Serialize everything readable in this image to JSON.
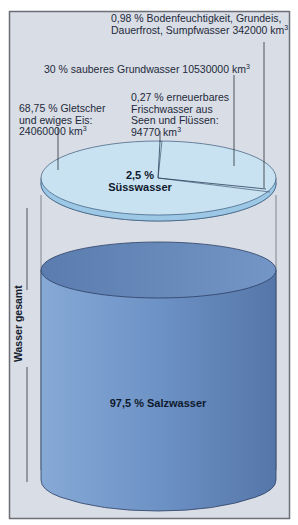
{
  "diagram": {
    "vertical_label": "Wasser gesamt",
    "salt_water": {
      "label": "97,5 % Salzwasser",
      "percent": 97.5
    },
    "fresh_water": {
      "label_line1": "2,5 %",
      "label_line2": "Süsswasser",
      "percent": 2.5
    },
    "fresh_breakdown": [
      {
        "id": "glaciers",
        "line1": "68,75 % Gletscher",
        "line2": "und ewiges Eis:",
        "line3": "24060000 km",
        "unit_sup": "3",
        "percent": 68.75,
        "volume_km3": 24060000
      },
      {
        "id": "groundwater",
        "line1": "30 % sauberes Grundwasser 10530000 km",
        "unit_sup": "3",
        "percent": 30,
        "volume_km3": 10530000
      },
      {
        "id": "lakes_rivers",
        "line1": "0,27 % erneuerbares",
        "line2": "Frischwasser aus",
        "line3": "Seen und Flüssen:",
        "line4": "94770 km",
        "unit_sup": "3",
        "percent": 0.27,
        "volume_km3": 94770
      },
      {
        "id": "soil_moisture",
        "line1": "0,98 % Bodenfeuchtigkeit, Grundeis,",
        "line2": "Dauerfrost, Sumpfwasser 342000 km",
        "unit_sup": "3",
        "percent": 0.98,
        "volume_km3": 342000
      }
    ],
    "colors": {
      "frame_bg": "#d9dde6",
      "frame_border": "#6b6e74",
      "disc_top": "#c9e2f1",
      "disc_rim": "#9cc8e6",
      "cyl_top": "#6a8fbf",
      "cyl_body": "#6f94c6",
      "cyl_outline": "#2c3f63"
    }
  }
}
